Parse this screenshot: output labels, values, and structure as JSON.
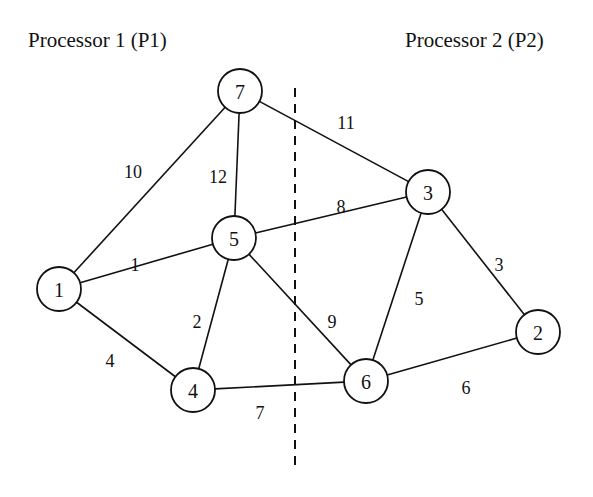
{
  "titles": {
    "left": "Processor 1 (P1)",
    "right": "Processor 2 (P2)"
  },
  "partition": {
    "x": 295,
    "y1": 88,
    "y2": 472,
    "style": "dashed"
  },
  "nodes": [
    {
      "id": "1",
      "label": "1",
      "x": 59,
      "y": 289,
      "processor": "P1"
    },
    {
      "id": "2",
      "label": "2",
      "x": 538,
      "y": 332,
      "processor": "P2"
    },
    {
      "id": "3",
      "label": "3",
      "x": 428,
      "y": 192,
      "processor": "P2"
    },
    {
      "id": "4",
      "label": "4",
      "x": 193,
      "y": 390,
      "processor": "P1"
    },
    {
      "id": "5",
      "label": "5",
      "x": 234,
      "y": 238,
      "processor": "P1"
    },
    {
      "id": "6",
      "label": "6",
      "x": 366,
      "y": 381,
      "processor": "P2"
    },
    {
      "id": "7",
      "label": "7",
      "x": 240,
      "y": 91,
      "processor": "P1"
    }
  ],
  "edges": [
    {
      "from": "7",
      "to": "1",
      "weight": "10",
      "lx": 133,
      "ly": 172
    },
    {
      "from": "7",
      "to": "5",
      "weight": "12",
      "lx": 218,
      "ly": 177
    },
    {
      "from": "7",
      "to": "3",
      "weight": "11",
      "lx": 346,
      "ly": 123
    },
    {
      "from": "1",
      "to": "5",
      "weight": "1",
      "lx": 135,
      "ly": 265
    },
    {
      "from": "5",
      "to": "3",
      "weight": "8",
      "lx": 341,
      "ly": 207
    },
    {
      "from": "1",
      "to": "4",
      "weight": "4",
      "lx": 110,
      "ly": 361
    },
    {
      "from": "5",
      "to": "4",
      "weight": "2",
      "lx": 197,
      "ly": 322
    },
    {
      "from": "5",
      "to": "6",
      "weight": "9",
      "lx": 332,
      "ly": 322
    },
    {
      "from": "4",
      "to": "6",
      "weight": "7",
      "lx": 260,
      "ly": 413
    },
    {
      "from": "3",
      "to": "6",
      "weight": "5",
      "lx": 419,
      "ly": 299
    },
    {
      "from": "3",
      "to": "2",
      "weight": "3",
      "lx": 499,
      "ly": 265
    },
    {
      "from": "6",
      "to": "2",
      "weight": "6",
      "lx": 466,
      "ly": 388
    }
  ],
  "node_radius": 22
}
